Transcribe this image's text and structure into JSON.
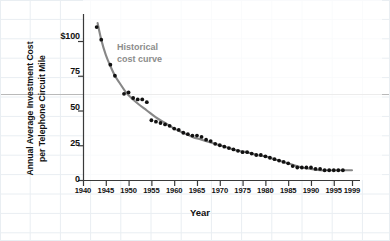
{
  "chart_data": {
    "type": "scatter",
    "title": "",
    "subtitle": "",
    "xlabel": "Year",
    "ylabel": "Annual Average Investment Cost\nper Telephone Circuit Mile",
    "xlim": [
      1940,
      1999
    ],
    "ylim": [
      0,
      118
    ],
    "grid": true,
    "grid_style": "faint background spreadsheet grid",
    "legend": "none",
    "xticks": [
      1940,
      1945,
      1950,
      1955,
      1960,
      1965,
      1970,
      1975,
      1980,
      1985,
      1990,
      1995,
      1999
    ],
    "xticklabels": [
      "1940",
      "1945",
      "1950",
      "1955",
      "1960",
      "1965",
      "1970",
      "1975",
      "1980",
      "1985",
      "1990",
      "1995",
      "1999"
    ],
    "yticks": [
      0,
      25,
      50,
      75,
      100
    ],
    "yticklabels": [
      "0",
      "25",
      "50",
      "75",
      "$100"
    ],
    "annotations": [
      {
        "text": "Historical\ncost curve",
        "x": 1951,
        "y": 88,
        "color": "#8c8c8c"
      }
    ],
    "series": [
      {
        "name": "Annual average investment cost per telephone circuit mile",
        "type": "scatter",
        "marker": "circle",
        "color": "#111111",
        "x": [
          1943,
          1944,
          1946,
          1947,
          1949,
          1950,
          1951,
          1952,
          1953,
          1954,
          1955,
          1956,
          1957,
          1958,
          1959,
          1960,
          1961,
          1962,
          1963,
          1964,
          1965,
          1966,
          1967,
          1968,
          1969,
          1970,
          1971,
          1972,
          1973,
          1974,
          1975,
          1976,
          1977,
          1978,
          1979,
          1980,
          1981,
          1982,
          1983,
          1984,
          1985,
          1986,
          1987,
          1988,
          1989,
          1990,
          1991,
          1992,
          1993,
          1994,
          1995,
          1996,
          1997
        ],
        "y": [
          110,
          101,
          83,
          75,
          62,
          63,
          59,
          58,
          58,
          56,
          43,
          42,
          41,
          40,
          39,
          37,
          36,
          34,
          33,
          32,
          32,
          31,
          29,
          28,
          26,
          25,
          24,
          23,
          22,
          21,
          20,
          20,
          19,
          18,
          18,
          17,
          16,
          15,
          14,
          13,
          12,
          10,
          9,
          9,
          9,
          9,
          8,
          8,
          7,
          7,
          7,
          7,
          7
        ]
      },
      {
        "name": "Historical cost curve (fitted)",
        "type": "line",
        "color": "#878787",
        "x": [
          1943.2,
          1944,
          1945,
          1946,
          1947,
          1948,
          1949,
          1950,
          1952,
          1954,
          1956,
          1958,
          1960,
          1962,
          1964,
          1966,
          1968,
          1970,
          1972,
          1974,
          1976,
          1978,
          1980,
          1982,
          1984,
          1986,
          1988,
          1990,
          1992,
          1994,
          1996,
          1998,
          1999
        ],
        "y": [
          113,
          101,
          90,
          82,
          75,
          70,
          65,
          61,
          55,
          50,
          45,
          41,
          37,
          34,
          31,
          29,
          27,
          25,
          23,
          21,
          20,
          18,
          17,
          15,
          13,
          11,
          9,
          8,
          7,
          7,
          7,
          7,
          7
        ]
      }
    ]
  },
  "axis": {
    "y_label_line1": "Annual Average Investment Cost",
    "y_label_line2": "per Telephone Circuit Mile",
    "x_label": "Year"
  },
  "annotation": {
    "line1": "Historical",
    "line2": "cost curve"
  },
  "colors": {
    "marker": "#111111",
    "curve": "#878787",
    "annotation_text": "#8c8c8c",
    "axis": "#3a3a3a",
    "grid_faint": "#e9eef2",
    "rule": "#b9b9b9",
    "background": "#ffffff"
  }
}
